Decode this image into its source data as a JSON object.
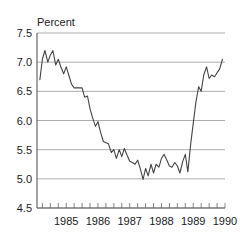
{
  "chart_data": {
    "type": "line",
    "title": "",
    "subtitle": "",
    "axis_title": "Percent",
    "xlabel": "",
    "ylabel": "Percent",
    "ylim": [
      4.5,
      7.5
    ],
    "ytick_labels": [
      "7.5",
      "7.0",
      "6.5",
      "6.0",
      "5.5",
      "5.0",
      "4.5"
    ],
    "ytick_values": [
      7.5,
      7.0,
      6.5,
      6.0,
      5.5,
      5.0,
      4.5
    ],
    "xtick_labels": [
      "1985",
      "1986",
      "1987",
      "1988",
      "1989",
      "1990"
    ],
    "xtick_values": [
      1985,
      1986,
      1987,
      1988,
      1989,
      1990
    ],
    "xlim": [
      1984.58,
      1990.5
    ],
    "minor_xticks_per_year": 4,
    "grid": "horizontal",
    "legend": "none",
    "legend_position": "none",
    "line_color": "#444444",
    "grid_color": "#8a8a8a",
    "axis_color": "#5a5a5a",
    "background_color": "#ffffff",
    "series": [
      {
        "name": "Percent",
        "x": [
          1984.67,
          1984.75,
          1984.83,
          1984.92,
          1985.0,
          1985.08,
          1985.17,
          1985.25,
          1985.33,
          1985.42,
          1985.5,
          1985.58,
          1985.67,
          1985.75,
          1985.83,
          1985.92,
          1986.0,
          1986.08,
          1986.17,
          1986.25,
          1986.33,
          1986.42,
          1986.5,
          1986.58,
          1986.67,
          1986.75,
          1986.83,
          1986.92,
          1987.0,
          1987.08,
          1987.17,
          1987.25,
          1987.33,
          1987.42,
          1987.5,
          1987.58,
          1987.67,
          1987.75,
          1987.83,
          1987.92,
          1988.0,
          1988.08,
          1988.17,
          1988.25,
          1988.33,
          1988.42,
          1988.5,
          1988.58,
          1988.67,
          1988.75,
          1988.83,
          1988.92,
          1989.0,
          1989.08,
          1989.17,
          1989.25,
          1989.33,
          1989.42,
          1989.5,
          1989.58,
          1989.67,
          1989.75,
          1989.83,
          1989.92,
          1990.0,
          1990.08,
          1990.17,
          1990.25,
          1990.33,
          1990.42
        ],
        "values": [
          6.7,
          7.05,
          7.2,
          7.0,
          7.12,
          7.2,
          6.95,
          7.05,
          6.92,
          6.8,
          6.92,
          6.78,
          6.62,
          6.56,
          6.56,
          6.56,
          6.56,
          6.4,
          6.42,
          6.2,
          6.05,
          5.9,
          5.98,
          5.8,
          5.64,
          5.62,
          5.6,
          5.45,
          5.5,
          5.35,
          5.5,
          5.38,
          5.52,
          5.4,
          5.3,
          5.28,
          5.25,
          5.32,
          5.18,
          4.99,
          5.18,
          5.05,
          5.25,
          5.1,
          5.25,
          5.2,
          5.35,
          5.42,
          5.32,
          5.22,
          5.2,
          5.28,
          5.22,
          5.1,
          5.3,
          5.42,
          5.12,
          5.6,
          5.95,
          6.3,
          6.58,
          6.5,
          6.78,
          6.92,
          6.72,
          6.78,
          6.75,
          6.82,
          6.88,
          7.05
        ]
      }
    ]
  }
}
